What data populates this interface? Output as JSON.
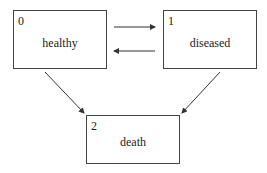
{
  "diagram": {
    "states": [
      {
        "id": "0",
        "label": "healthy"
      },
      {
        "id": "1",
        "label": "diseased"
      },
      {
        "id": "2",
        "label": "death"
      }
    ],
    "transitions": [
      {
        "from": "0",
        "to": "1"
      },
      {
        "from": "1",
        "to": "0"
      },
      {
        "from": "0",
        "to": "2"
      },
      {
        "from": "1",
        "to": "2"
      }
    ]
  }
}
